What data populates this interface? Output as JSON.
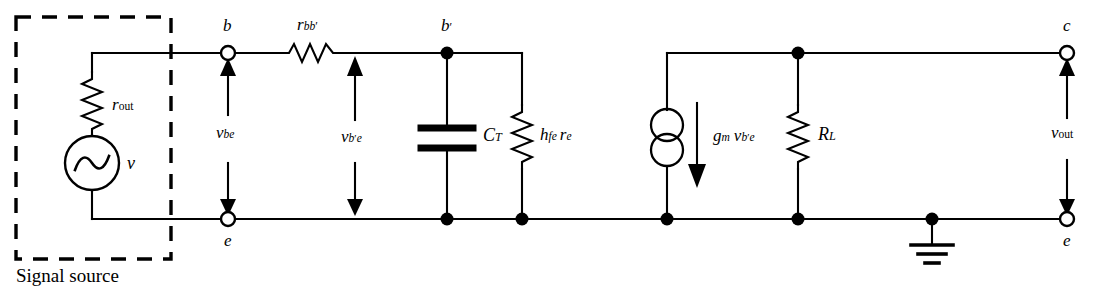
{
  "figure": {
    "type": "circuit-schematic",
    "caption": "Signal source"
  },
  "colors": {
    "wire": "#000000",
    "background": "#ffffff",
    "text": "#000000"
  },
  "labels": {
    "signal_source": "Signal source",
    "r_out": {
      "base": "r",
      "sub": "out"
    },
    "source_v": "v",
    "node_b": "b",
    "node_b_prime": {
      "base": "b",
      "prime": "′"
    },
    "node_e_left": "e",
    "node_c": "c",
    "node_e_right": "e",
    "r_bb": {
      "base": "r",
      "sub": "bb",
      "prime": "′"
    },
    "v_be": {
      "base": "v",
      "sub": "be"
    },
    "v_bpe": {
      "base": "v",
      "sub": "b",
      "subprime": "′",
      "sub2": "e"
    },
    "c_t": {
      "base": "C",
      "sub": "T"
    },
    "hfe_re": {
      "base1": "h",
      "sub1": "fe",
      "base2": "r",
      "sub2": "e"
    },
    "gm_vbpe": {
      "base1": "g",
      "sub1": "m",
      "base2": "v",
      "sub2": "b",
      "subprime": "′",
      "sub3": "e"
    },
    "r_l": {
      "base": "R",
      "sub": "L"
    },
    "v_out": {
      "base": "v",
      "sub": "out"
    }
  },
  "components": [
    {
      "name": "r-out-resistor",
      "label": "r_out",
      "orientation": "vertical",
      "section": "signal-source"
    },
    {
      "name": "ac-voltage-source",
      "label": "v",
      "symbol": "sine-circle",
      "section": "signal-source"
    },
    {
      "name": "r-bb-prime-resistor",
      "label": "r_bb'",
      "orientation": "horizontal",
      "section": "base-network"
    },
    {
      "name": "ct-capacitor",
      "label": "C_T",
      "orientation": "vertical",
      "section": "base-network"
    },
    {
      "name": "hfe-re-resistor",
      "label": "h_fe r_e",
      "orientation": "vertical",
      "section": "base-network"
    },
    {
      "name": "gm-current-source",
      "label": "g_m v_b'e",
      "symbol": "double-circle",
      "section": "output-network"
    },
    {
      "name": "rl-resistor",
      "label": "R_L",
      "orientation": "vertical",
      "section": "output-network"
    },
    {
      "name": "ground-symbol",
      "label": "",
      "symbol": "earth-ground",
      "section": "output-network"
    }
  ],
  "terminals": [
    {
      "name": "terminal-b",
      "label": "b",
      "style": "open-circle"
    },
    {
      "name": "terminal-e-left",
      "label": "e",
      "style": "open-circle"
    },
    {
      "name": "terminal-c",
      "label": "c",
      "style": "open-circle"
    },
    {
      "name": "terminal-e-right",
      "label": "e",
      "style": "open-circle"
    },
    {
      "name": "node-b-prime",
      "label": "b'",
      "style": "filled-dot"
    }
  ],
  "voltage_arrows": [
    {
      "name": "v-be-arrow",
      "label": "v_be",
      "direction": "double-headed-vertical"
    },
    {
      "name": "v-b-prime-e-arrow",
      "label": "v_b'e",
      "direction": "double-headed-vertical"
    },
    {
      "name": "v-out-arrow",
      "label": "v_out",
      "direction": "double-headed-vertical"
    },
    {
      "name": "gm-current-arrow",
      "label": "g_m v_b'e",
      "direction": "down"
    }
  ]
}
